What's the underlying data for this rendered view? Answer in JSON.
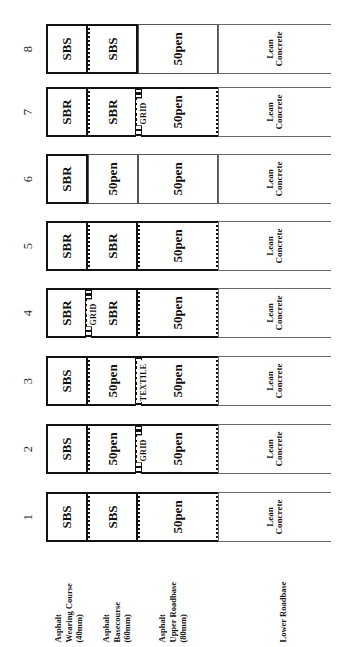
{
  "figure": {
    "orientation": "rotated-90-ccw",
    "caption": "",
    "layer_labels": [
      {
        "name": "asphalt-wearing-course",
        "line1": "Asphalt",
        "line2": "Wearing Course",
        "line3": "(40mm)"
      },
      {
        "name": "asphalt-basecourse",
        "line1": "Asphalt",
        "line2": "Basecourse",
        "line3": "(60mm)"
      },
      {
        "name": "asphalt-upper-roadbase",
        "line1": "Asphalt",
        "line2": "Upper Roadbase",
        "line3": "(80mm)"
      },
      {
        "name": "lower-roadbase",
        "line1": "Lower Roadbase",
        "line2": "",
        "line3": ""
      }
    ],
    "section_numbers": [
      "1",
      "2",
      "3",
      "4",
      "5",
      "6",
      "7",
      "8"
    ],
    "sections": [
      {
        "number": "1",
        "cells": [
          {
            "label": "SBS",
            "layer": "wearing-course",
            "weight": "heavy"
          },
          {
            "label": "SBS",
            "layer": "basecourse",
            "weight": "heavy"
          },
          {
            "label": "50pen",
            "layer": "upper-roadbase",
            "weight": "heavy"
          },
          {
            "label": "Lean Concrete",
            "layer": "lower-roadbase",
            "weight": "hair"
          }
        ],
        "interlayers": []
      },
      {
        "number": "2",
        "cells": [
          {
            "label": "SBS",
            "layer": "wearing-course",
            "weight": "heavy"
          },
          {
            "label": "50pen",
            "layer": "basecourse",
            "weight": "heavy"
          },
          {
            "label": "50pen",
            "layer": "upper-roadbase",
            "weight": "heavy"
          },
          {
            "label": "Lean Concrete",
            "layer": "lower-roadbase",
            "weight": "hair"
          }
        ],
        "interlayers": [
          {
            "label": "GRID",
            "at": "basecourse-upper-roadbase"
          }
        ]
      },
      {
        "number": "3",
        "cells": [
          {
            "label": "SBS",
            "layer": "wearing-course",
            "weight": "heavy"
          },
          {
            "label": "50pen",
            "layer": "basecourse",
            "weight": "heavy"
          },
          {
            "label": "50pen",
            "layer": "upper-roadbase",
            "weight": "heavy"
          },
          {
            "label": "Lean Concrete",
            "layer": "lower-roadbase",
            "weight": "hair"
          }
        ],
        "interlayers": [
          {
            "label": "TEXTILE",
            "at": "basecourse-upper-roadbase"
          }
        ]
      },
      {
        "number": "4",
        "cells": [
          {
            "label": "SBR",
            "layer": "wearing-course",
            "weight": "heavy"
          },
          {
            "label": "SBR",
            "layer": "basecourse",
            "weight": "heavy"
          },
          {
            "label": "50pen",
            "layer": "upper-roadbase",
            "weight": "heavy"
          },
          {
            "label": "Lean Concrete",
            "layer": "lower-roadbase",
            "weight": "hair"
          }
        ],
        "interlayers": [
          {
            "label": "GRID",
            "at": "wearing-course-basecourse"
          }
        ]
      },
      {
        "number": "5",
        "cells": [
          {
            "label": "SBR",
            "layer": "wearing-course",
            "weight": "heavy"
          },
          {
            "label": "SBR",
            "layer": "basecourse",
            "weight": "heavy"
          },
          {
            "label": "50pen",
            "layer": "upper-roadbase",
            "weight": "heavy"
          },
          {
            "label": "Lean Concrete",
            "layer": "lower-roadbase",
            "weight": "hair"
          }
        ],
        "interlayers": []
      },
      {
        "number": "6",
        "cells": [
          {
            "label": "SBR",
            "layer": "wearing-course",
            "weight": "heavy"
          },
          {
            "label": "50pen",
            "layer": "basecourse",
            "weight": "thin"
          },
          {
            "label": "50pen",
            "layer": "upper-roadbase",
            "weight": "thin"
          },
          {
            "label": "Lean Concrete",
            "layer": "lower-roadbase",
            "weight": "hair"
          }
        ],
        "interlayers": []
      },
      {
        "number": "7",
        "cells": [
          {
            "label": "SBR",
            "layer": "wearing-course",
            "weight": "heavy"
          },
          {
            "label": "SBR",
            "layer": "basecourse",
            "weight": "heavy"
          },
          {
            "label": "50pen",
            "layer": "upper-roadbase",
            "weight": "heavy"
          },
          {
            "label": "Lean Concrete",
            "layer": "lower-roadbase",
            "weight": "hair"
          }
        ],
        "interlayers": [
          {
            "label": "GRID",
            "at": "basecourse-upper-roadbase"
          }
        ]
      },
      {
        "number": "8",
        "cells": [
          {
            "label": "SBS",
            "layer": "wearing-course",
            "weight": "heavy"
          },
          {
            "label": "SBS",
            "layer": "basecourse",
            "weight": "heavy"
          },
          {
            "label": "50pen",
            "layer": "upper-roadbase",
            "weight": "thin"
          },
          {
            "label": "Lean Concrete",
            "layer": "lower-roadbase",
            "weight": "hair"
          }
        ],
        "interlayers": []
      }
    ]
  },
  "geometry": {
    "layer_x": [
      0,
      42,
      92,
      172
    ],
    "layer_w": [
      42,
      50,
      80,
      113
    ],
    "section_tops": [
      492,
      424,
      356,
      288,
      221,
      154,
      87,
      24
    ],
    "legend_left": [
      8,
      56,
      112,
      212
    ]
  }
}
